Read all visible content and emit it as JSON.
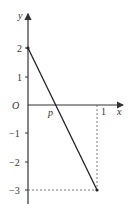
{
  "figure": {
    "type": "coordinate-graph",
    "axes": {
      "x_label": "x",
      "y_label": "y",
      "origin_label": "O"
    },
    "y_ticks": [
      {
        "value": 2,
        "label": "2"
      },
      {
        "value": 1,
        "label": "1"
      },
      {
        "value": -1,
        "label": "−1"
      },
      {
        "value": -2,
        "label": "−2"
      },
      {
        "value": -3,
        "label": "−3"
      }
    ],
    "x_ticks": [
      {
        "value": 1,
        "label": "1"
      }
    ],
    "intercept_label": "p",
    "segment": {
      "start": [
        0,
        2
      ],
      "end": [
        1,
        -3
      ]
    },
    "colors": {
      "axis": "#333333",
      "line": "#222222",
      "dashed": "#555555"
    }
  }
}
